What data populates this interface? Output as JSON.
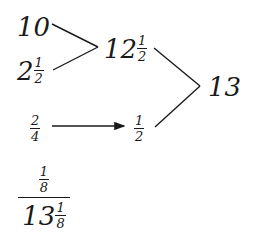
{
  "diagram": {
    "type": "addition-tree",
    "nodes": {
      "a": {
        "whole": "10"
      },
      "b": {
        "whole": "2",
        "num": "1",
        "den": "2"
      },
      "sum_ab": {
        "whole": "12",
        "num": "1",
        "den": "2"
      },
      "c": {
        "num": "2",
        "den": "4"
      },
      "c_simplified": {
        "num": "1",
        "den": "2"
      },
      "total": {
        "whole": "13"
      },
      "final_fraction": {
        "numerator": {
          "num": "1",
          "den": "8"
        },
        "denominator": {
          "whole": "13",
          "num": "1",
          "den": "8"
        }
      }
    },
    "edges": [
      {
        "from": "a",
        "to": "sum_ab",
        "style": "line"
      },
      {
        "from": "b",
        "to": "sum_ab",
        "style": "line"
      },
      {
        "from": "sum_ab",
        "to": "total",
        "style": "line"
      },
      {
        "from": "c_simplified",
        "to": "total",
        "style": "line"
      },
      {
        "from": "c",
        "to": "c_simplified",
        "style": "arrow"
      }
    ],
    "colors": {
      "ink": "#1a1a1a",
      "background": "#ffffff"
    }
  }
}
